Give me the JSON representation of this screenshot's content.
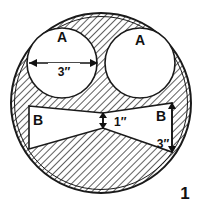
{
  "figure": {
    "number": "1",
    "type": "cross-section-diagram",
    "parts": [
      {
        "id": "circle-a-left",
        "label": "A"
      },
      {
        "id": "circle-a-right",
        "label": "A"
      },
      {
        "id": "bowtie-b-left",
        "label": "B"
      },
      {
        "id": "bowtie-b-right",
        "label": "B"
      }
    ],
    "dimensions": [
      {
        "id": "diameter-a",
        "value": "3″",
        "orientation": "horizontal"
      },
      {
        "id": "waist-b",
        "value": "1″",
        "orientation": "vertical"
      },
      {
        "id": "height-b-right",
        "value": "3″",
        "orientation": "vertical"
      }
    ],
    "colors": {
      "line": "#1a1a1a",
      "fill": "#ffffff",
      "hatch": "#2a2a2a",
      "background": "#ffffff"
    }
  }
}
